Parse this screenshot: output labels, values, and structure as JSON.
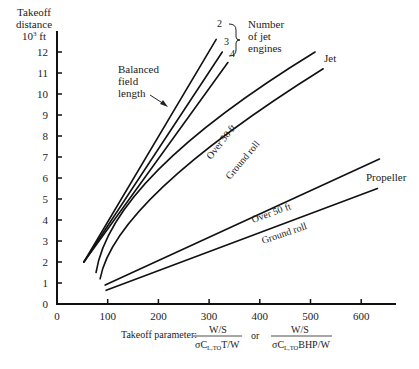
{
  "chart_data": {
    "type": "line",
    "title": "",
    "xlabel": "Takeoff parameter: W/S / (σ C_L,TO T/W) or W/S / (σ C_L,TO BHP/W)",
    "ylabel": "Takeoff distance 10^3 ft",
    "xlim": [
      0,
      670
    ],
    "ylim": [
      0,
      13.5
    ],
    "x_ticks": [
      0,
      100,
      200,
      300,
      400,
      500,
      600
    ],
    "y_ticks": [
      0,
      1,
      2,
      3,
      4,
      5,
      6,
      7,
      8,
      9,
      10,
      11,
      12
    ],
    "grid": false,
    "legend_position": "inline annotations",
    "series": [
      {
        "name": "Balanced field length, 2 jet engines",
        "group": "Balanced field length",
        "points": [
          [
            53,
            2.0
          ],
          [
            314,
            12.6
          ]
        ]
      },
      {
        "name": "Balanced field length, 3 jet engines",
        "group": "Balanced field length",
        "points": [
          [
            53,
            2.0
          ],
          [
            326,
            12.0
          ]
        ]
      },
      {
        "name": "Balanced field length, 4 jet engines",
        "group": "Balanced field length",
        "points": [
          [
            53,
            2.0
          ],
          [
            337,
            11.5
          ]
        ]
      },
      {
        "name": "Jet, Over 50 ft",
        "group": "Jet",
        "points": [
          [
            77,
            1.5
          ],
          [
            200,
            6.4
          ],
          [
            509,
            12.0
          ]
        ]
      },
      {
        "name": "Jet, Ground roll",
        "group": "Jet",
        "points": [
          [
            85,
            1.2
          ],
          [
            210,
            5.6
          ],
          [
            525,
            11.2
          ]
        ]
      },
      {
        "name": "Propeller, Over 50 ft",
        "group": "Propeller",
        "points": [
          [
            95,
            0.9
          ],
          [
            636,
            6.9
          ]
        ]
      },
      {
        "name": "Propeller, Ground roll",
        "group": "Propeller",
        "points": [
          [
            97,
            0.65
          ],
          [
            632,
            5.5
          ]
        ]
      }
    ],
    "annotations": {
      "engine_numbers": [
        "2",
        "3",
        "4"
      ],
      "engines_label": [
        "Number",
        "of jet",
        "engines"
      ],
      "bfl_label": [
        "Balanced",
        "field",
        "length"
      ],
      "jet_label": "Jet",
      "propeller_label": "Propeller",
      "over_50ft": "Over 50 ft",
      "ground_roll": "Ground roll"
    }
  },
  "axes": {
    "y_title": [
      "Takeoff",
      "distance",
      "10",
      "3",
      " ft"
    ],
    "y_tick_labels": [
      "0",
      "1",
      "2",
      "3",
      "4",
      "5",
      "6",
      "7",
      "8",
      "9",
      "10",
      "11",
      "12"
    ],
    "x_tick_labels": [
      "0",
      "100",
      "200",
      "300",
      "400",
      "500",
      "600"
    ],
    "x_title": {
      "prefix": "Takeoff parameter:",
      "frac1_num": "W/S",
      "frac1_den_a": "σC",
      "frac1_den_sub": "L,TO",
      "frac1_den_b": "T/W",
      "or": "or",
      "frac2_num": "W/S",
      "frac2_den_a": "σC",
      "frac2_den_sub": "L,TO",
      "frac2_den_b": "BHP/W"
    }
  }
}
